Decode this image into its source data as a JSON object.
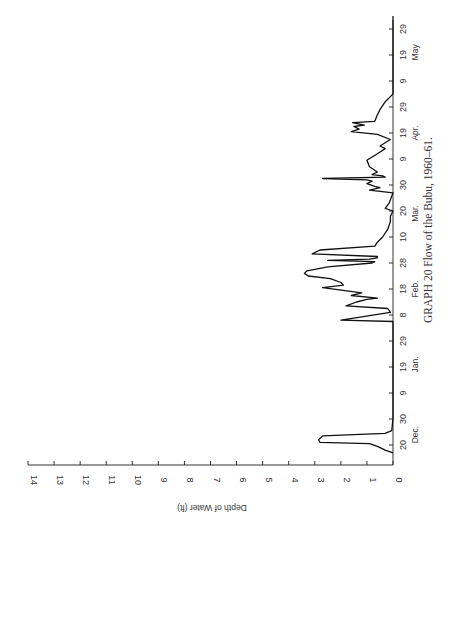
{
  "chart_data": {
    "type": "line",
    "orientation": "rotated-90-ccw",
    "title": "GRAPH 20   Flow of the Bubu, 1960–61.",
    "xlabel": "",
    "ylabel": "Depth of Water (ft)",
    "ylim": [
      0,
      14
    ],
    "y_ticks": [
      0,
      1,
      2,
      3,
      4,
      5,
      6,
      7,
      8,
      9,
      10,
      11,
      12,
      13,
      14
    ],
    "x_ticks": [
      {
        "label": "20",
        "month": "Dec.",
        "day_offset": 0
      },
      {
        "label": "30",
        "month": "",
        "day_offset": 10
      },
      {
        "label": "9",
        "month": "",
        "day_offset": 20
      },
      {
        "label": "19",
        "month": "Jan.",
        "day_offset": 30
      },
      {
        "label": "29",
        "month": "",
        "day_offset": 40
      },
      {
        "label": "8",
        "month": "Feb.",
        "day_offset": 50
      },
      {
        "label": "18",
        "month": "",
        "day_offset": 60
      },
      {
        "label": "28",
        "month": "",
        "day_offset": 70
      },
      {
        "label": "10",
        "month": "Mar.",
        "day_offset": 80
      },
      {
        "label": "20",
        "month": "",
        "day_offset": 90
      },
      {
        "label": "30",
        "month": "",
        "day_offset": 100
      },
      {
        "label": "9",
        "month": "Apr.",
        "day_offset": 110
      },
      {
        "label": "19",
        "month": "",
        "day_offset": 120
      },
      {
        "label": "29",
        "month": "",
        "day_offset": 130
      },
      {
        "label": "9",
        "month": "May",
        "day_offset": 140
      },
      {
        "label": "19",
        "month": "",
        "day_offset": 150
      },
      {
        "label": "29",
        "month": "",
        "day_offset": 160
      }
    ],
    "month_labels": [
      {
        "label": "Dec.",
        "day_offset": 4
      },
      {
        "label": "Jan.",
        "day_offset": 31
      },
      {
        "label": "Feb.",
        "day_offset": 60
      },
      {
        "label": "Mar.",
        "day_offset": 89
      },
      {
        "label": "Apr.",
        "day_offset": 120
      },
      {
        "label": "May",
        "day_offset": 151
      }
    ],
    "series": [
      {
        "name": "Depth of water, Bubu river",
        "x_day_offset": [
          -3,
          -2,
          -0.5,
          0.5,
          1,
          2,
          3.5,
          4.5,
          5.5,
          10,
          20,
          30,
          40,
          47.5,
          48,
          51,
          52.5,
          53.5,
          55,
          56,
          56.5,
          57.5,
          58.5,
          60.5,
          61.5,
          62.5,
          64,
          65,
          66,
          67,
          68.5,
          70,
          70.5,
          71,
          71.5,
          72,
          72.5,
          73.5,
          75,
          76.5,
          78,
          80,
          83,
          86,
          88,
          90,
          91,
          93,
          97,
          98,
          99,
          99.5,
          100.5,
          101.5,
          102,
          102.5,
          103,
          103.5,
          104,
          105,
          107,
          109.5,
          112,
          114,
          115,
          117.5,
          119.5,
          120.5,
          121.5,
          122.5,
          123,
          124,
          124.5,
          127,
          129,
          130.5,
          132,
          134,
          135,
          150,
          165
        ],
        "y_depth": [
          0,
          0.3,
          0.6,
          0.9,
          2.8,
          2.85,
          2.7,
          0.3,
          0.05,
          0,
          0,
          0,
          0,
          0,
          2.0,
          0.1,
          0.2,
          1.8,
          1.4,
          1.0,
          0.6,
          1.6,
          1.2,
          2.7,
          1.9,
          2.0,
          2.4,
          3.25,
          3.4,
          3.3,
          2.5,
          0.8,
          0.7,
          2.5,
          0.9,
          0.6,
          0.6,
          3.1,
          2.8,
          0.7,
          0.6,
          0.4,
          0.2,
          0.1,
          0.1,
          0,
          0.3,
          0.15,
          0,
          0.9,
          0.5,
          0.7,
          1.0,
          0.8,
          1.0,
          2.7,
          0.3,
          0.4,
          0.8,
          0.6,
          0.9,
          1.0,
          0.6,
          0.3,
          0.5,
          0.1,
          0.6,
          1.6,
          1.3,
          1.5,
          1.1,
          1.55,
          0.7,
          0.6,
          0.5,
          0.4,
          0.3,
          0.1,
          0,
          0,
          0
        ]
      }
    ],
    "grid": false,
    "legend": "none"
  },
  "caption": "GRAPH 20   Flow of the Bubu, 1960–61.",
  "axis_title": "Depth of Water (ft)"
}
